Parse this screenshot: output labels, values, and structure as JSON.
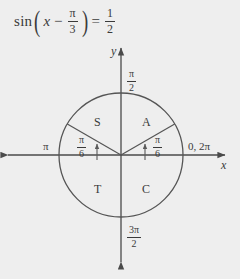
{
  "figure": {
    "background_color": "#eeeeee",
    "stroke_color": "#555555",
    "text_color": "#3a3a3a"
  },
  "equation": {
    "function": "sin",
    "open_paren": "(",
    "variable": "x",
    "minus": "−",
    "angle_numerator": "π",
    "angle_denominator": "3",
    "close_paren": ")",
    "equals": "=",
    "value_numerator": "1",
    "value_denominator": "2",
    "full_text": "sin(x − π/3) = 1/2"
  },
  "axes": {
    "y_label": "y",
    "x_label": "x",
    "top_label_numerator": "π",
    "top_label_denominator": "2",
    "bottom_label_numerator": "3π",
    "bottom_label_denominator": "2",
    "left_label": "π",
    "right_label": "0, 2π"
  },
  "circle": {
    "center_x": 121,
    "center_y": 155,
    "radius": 62
  },
  "quadrants": [
    {
      "letter": "S",
      "name": "sine-quadrant",
      "position": "upper-left"
    },
    {
      "letter": "A",
      "name": "all-quadrant",
      "position": "upper-right"
    },
    {
      "letter": "T",
      "name": "tangent-quadrant",
      "position": "lower-left"
    },
    {
      "letter": "C",
      "name": "cosine-quadrant",
      "position": "lower-right"
    }
  ],
  "angles": [
    {
      "numerator": "π",
      "denominator": "6",
      "side": "left",
      "degrees": 30,
      "measured_from": "negative-x-axis"
    },
    {
      "numerator": "π",
      "denominator": "6",
      "side": "right",
      "degrees": 30,
      "measured_from": "positive-x-axis"
    }
  ]
}
